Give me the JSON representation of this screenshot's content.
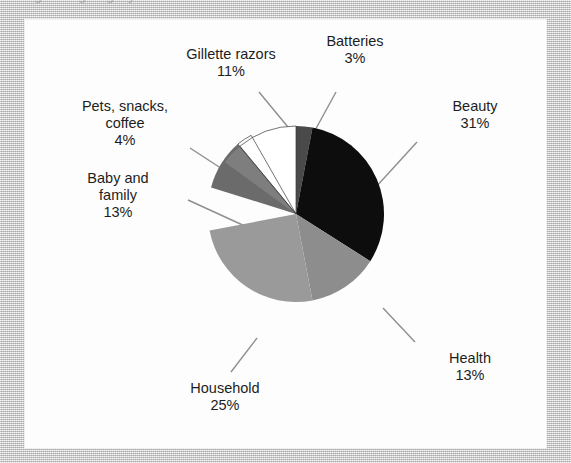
{
  "caption": {
    "text": "ngu e o gategory"
  },
  "chart_data": {
    "type": "pie",
    "title": "",
    "categories": [
      "Batteries",
      "Beauty",
      "Health",
      "Household",
      "Baby and family",
      "Pets, snacks, coffee",
      "Gillette razors"
    ],
    "values": [
      3,
      31,
      13,
      25,
      13,
      4,
      11
    ],
    "value_unit": "%",
    "start_angle_deg": 0,
    "direction": "clockwise",
    "legend": "none",
    "labels_position": "outside-with-leader-lines",
    "slices": [
      {
        "name": "Batteries",
        "value": 3,
        "value_label": "3%",
        "color": "#4a4a4a"
      },
      {
        "name": "Beauty",
        "value": 31,
        "value_label": "31%",
        "color": "#0d0d0d"
      },
      {
        "name": "Health",
        "value": 13,
        "value_label": "13%",
        "color": "#8d8d8d"
      },
      {
        "name": "Household",
        "value": 25,
        "value_label": "25%",
        "color": "#9a9a9a"
      },
      {
        "name": "Baby and family",
        "value": 13,
        "value_label": "13%",
        "color": "#6b6b6b"
      },
      {
        "name": "Pets, snacks, coffee",
        "value": 4,
        "value_label": "4%",
        "color": "#7e7e7e"
      },
      {
        "name": "Gillette razors",
        "value": 11,
        "value_label": "11%",
        "color": "#ffffff"
      }
    ]
  },
  "labels": {
    "gillette": {
      "name": "Gillette razors",
      "pct": "11%"
    },
    "batteries": {
      "name": "Batteries",
      "pct": "3%"
    },
    "beauty": {
      "name": "Beauty",
      "pct": "31%"
    },
    "pets": {
      "name_line1": "Pets, snacks,",
      "name_line2": "coffee",
      "pct": "4%"
    },
    "baby": {
      "name_line1": "Baby and",
      "name_line2": "family",
      "pct": "13%"
    },
    "household": {
      "name": "Household",
      "pct": "25%"
    },
    "health": {
      "name": "Health",
      "pct": "13%"
    }
  },
  "colors": {
    "panel_background": "#fdfdfd",
    "page_background": "#d8d8d8",
    "text": "#1d1d1d",
    "leader_line": "#8e8e8e"
  }
}
